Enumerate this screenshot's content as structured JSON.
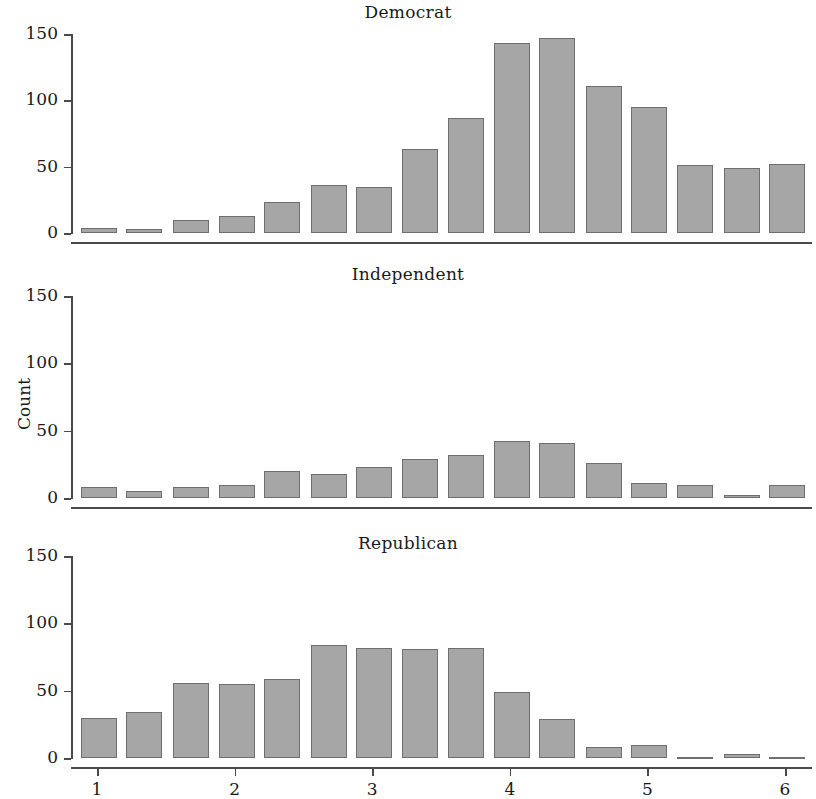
{
  "figure": {
    "ylabel": "Count",
    "y_ticks": [
      0,
      50,
      100,
      150
    ],
    "x_ticks": [
      1,
      2,
      3,
      4,
      5,
      6
    ],
    "bar_color": "#a6a6a6",
    "bar_edge_color": "#6e6e6e",
    "axis_color": "#4a4a4a"
  },
  "chart_data": {
    "type": "bar",
    "title": "",
    "xlabel": "",
    "ylabel": "Count",
    "ylim": [
      0,
      150
    ],
    "xlim": [
      0.82,
      6.2
    ],
    "yticks": [
      0,
      50,
      100,
      150
    ],
    "xticks": [
      1,
      2,
      3,
      4,
      5,
      6
    ],
    "grid": false,
    "legend": "none",
    "layout": "3 stacked panels sharing x and y axes",
    "bin_centers": [
      1.0,
      1.33,
      1.67,
      2.0,
      2.33,
      2.67,
      3.0,
      3.33,
      3.67,
      4.0,
      4.33,
      4.67,
      5.0,
      5.33,
      5.67,
      6.0
    ],
    "panels": [
      {
        "title": "Democrat",
        "values": [
          4,
          3,
          10,
          13,
          23,
          36,
          35,
          63,
          87,
          143,
          147,
          111,
          95,
          51,
          49,
          52
        ]
      },
      {
        "title": "Independent",
        "values": [
          8,
          5,
          8,
          10,
          20,
          18,
          23,
          29,
          32,
          42,
          41,
          26,
          11,
          10,
          2,
          10
        ]
      },
      {
        "title": "Republican",
        "values": [
          30,
          34,
          56,
          55,
          59,
          84,
          82,
          81,
          82,
          49,
          29,
          8,
          10,
          1,
          3,
          0
        ]
      }
    ]
  }
}
